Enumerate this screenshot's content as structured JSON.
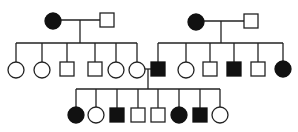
{
  "title": "Pedigree chart",
  "legend": {
    "square": "male",
    "circle": "female",
    "filled": "affected",
    "open": "unaffected"
  },
  "colors": {
    "affected": "#111111",
    "unaffected": "#ffffff",
    "line": "#222222"
  },
  "generations": [
    {
      "id": "I",
      "individuals": [
        {
          "id": "I-1",
          "sex": "female",
          "affected": true,
          "x": 53,
          "y": 21
        },
        {
          "id": "I-2",
          "sex": "male",
          "affected": false,
          "x": 107,
          "y": 20
        },
        {
          "id": "I-3",
          "sex": "female",
          "affected": true,
          "x": 196,
          "y": 22
        },
        {
          "id": "I-4",
          "sex": "male",
          "affected": false,
          "x": 251,
          "y": 21
        }
      ]
    },
    {
      "id": "II",
      "individuals": [
        {
          "id": "II-1",
          "sex": "female",
          "affected": false,
          "x": 16,
          "y": 70
        },
        {
          "id": "II-2",
          "sex": "female",
          "affected": false,
          "x": 42,
          "y": 70
        },
        {
          "id": "II-3",
          "sex": "male",
          "affected": false,
          "x": 67,
          "y": 69
        },
        {
          "id": "II-4",
          "sex": "male",
          "affected": false,
          "x": 95,
          "y": 69
        },
        {
          "id": "II-5",
          "sex": "female",
          "affected": false,
          "x": 116,
          "y": 70
        },
        {
          "id": "II-6",
          "sex": "female",
          "affected": false,
          "x": 137,
          "y": 70
        },
        {
          "id": "II-7",
          "sex": "male",
          "affected": true,
          "x": 158,
          "y": 69
        },
        {
          "id": "II-8",
          "sex": "female",
          "affected": false,
          "x": 186,
          "y": 70
        },
        {
          "id": "II-9",
          "sex": "male",
          "affected": false,
          "x": 210,
          "y": 69
        },
        {
          "id": "II-10",
          "sex": "male",
          "affected": true,
          "x": 234,
          "y": 69
        },
        {
          "id": "II-11",
          "sex": "male",
          "affected": false,
          "x": 258,
          "y": 69
        },
        {
          "id": "II-12",
          "sex": "female",
          "affected": true,
          "x": 283,
          "y": 69
        }
      ]
    },
    {
      "id": "III",
      "individuals": [
        {
          "id": "III-1",
          "sex": "female",
          "affected": true,
          "x": 76,
          "y": 115
        },
        {
          "id": "III-2",
          "sex": "female",
          "affected": false,
          "x": 96,
          "y": 115
        },
        {
          "id": "III-3",
          "sex": "male",
          "affected": true,
          "x": 117,
          "y": 115
        },
        {
          "id": "III-4",
          "sex": "male",
          "affected": false,
          "x": 138,
          "y": 115
        },
        {
          "id": "III-5",
          "sex": "male",
          "affected": false,
          "x": 158,
          "y": 115
        },
        {
          "id": "III-6",
          "sex": "female",
          "affected": true,
          "x": 179,
          "y": 115
        },
        {
          "id": "III-7",
          "sex": "male",
          "affected": true,
          "x": 200,
          "y": 115
        },
        {
          "id": "III-8",
          "sex": "female",
          "affected": false,
          "x": 220,
          "y": 115
        }
      ]
    }
  ],
  "matings": [
    {
      "a": "I-1",
      "b": "I-2",
      "line_y": 20,
      "drop_x": 80,
      "sib_y": 43,
      "children": [
        "II-1",
        "II-2",
        "II-3",
        "II-4",
        "II-5",
        "II-6"
      ]
    },
    {
      "a": "I-3",
      "b": "I-4",
      "line_y": 21,
      "drop_x": 221,
      "sib_y": 43,
      "children": [
        "II-7",
        "II-8",
        "II-9",
        "II-10",
        "II-11",
        "II-12"
      ]
    },
    {
      "a": "II-6",
      "b": "II-7",
      "line_y": 69,
      "drop_x": 148,
      "sib_y": 89,
      "children": [
        "III-1",
        "III-2",
        "III-3",
        "III-4",
        "III-5",
        "III-6",
        "III-7",
        "III-8"
      ]
    }
  ],
  "symbol_size": {
    "circle_r": 8,
    "square_half": 7
  }
}
